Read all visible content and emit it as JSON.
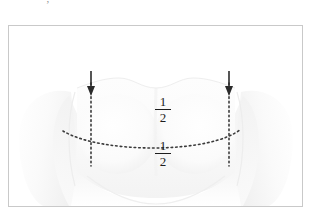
{
  "caption": {
    "clipped_top_text": "— — — , — — — — — — — —"
  },
  "figure": {
    "name": "chest-anatomy-diagram",
    "frame": {
      "border_color": "#c9c9c9",
      "background": "#ffffff"
    },
    "illustration": {
      "subject": "anterior-chest-torso",
      "fill_light": "#fdfdfd",
      "fill_mid": "#f4f4f4",
      "fill_shadow": "#e8e8e8",
      "outline": "#ededed"
    },
    "markers": {
      "dotted_color": "#3a3a3a",
      "arrow_color": "#2b2b2b",
      "left_arrow": {
        "label": "left-landmark-arrow",
        "x": 82,
        "y_top": 45,
        "y_tip": 68
      },
      "right_arrow": {
        "label": "right-landmark-arrow",
        "x": 220,
        "y_top": 45,
        "y_tip": 68
      },
      "left_vertical_guide": {
        "label": "left-vertical-dotted-guide",
        "x": 82,
        "y_top": 57,
        "y_bottom": 140
      },
      "right_vertical_guide": {
        "label": "right-vertical-dotted-guide",
        "x": 220,
        "y_top": 57,
        "y_bottom": 140
      },
      "horizontal_curve": {
        "label": "inframammary-dotted-curve",
        "x_start": 54,
        "x_end": 232,
        "y_ends": 105,
        "y_low": 122
      }
    },
    "labels": [
      {
        "name": "fraction-label-upper",
        "numerator": "1",
        "denominator": "2"
      },
      {
        "name": "fraction-label-lower",
        "numerator": "1",
        "denominator": "2"
      }
    ]
  }
}
